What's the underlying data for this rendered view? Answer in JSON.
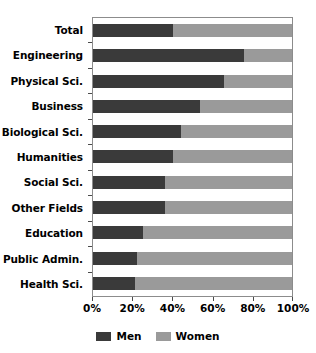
{
  "chart_data": {
    "type": "bar",
    "subtype": "horizontal-stacked-100-percent",
    "title": "",
    "xlabel": "",
    "ylabel": "",
    "xlim": [
      0,
      100
    ],
    "xticks": [
      0,
      20,
      40,
      60,
      80,
      100
    ],
    "xtick_labels": [
      "0%",
      "20%",
      "40%",
      "60%",
      "80%",
      "100%"
    ],
    "grid": false,
    "legend_position": "bottom-center",
    "categories": [
      "Total",
      "Engineering",
      "Physical Sci.",
      "Business",
      "Biological Sci.",
      "Humanities",
      "Social Sci.",
      "Other Fields",
      "Education",
      "Public Admin.",
      "Health Sci."
    ],
    "series": [
      {
        "name": "Men",
        "color": "#3a3a3a",
        "values": [
          40,
          76,
          66,
          54,
          44,
          40,
          36,
          36,
          25,
          22,
          21
        ]
      },
      {
        "name": "Women",
        "color": "#9a9a9a",
        "values": [
          60,
          24,
          34,
          46,
          56,
          60,
          64,
          64,
          75,
          78,
          79
        ]
      }
    ]
  },
  "legend": {
    "items": [
      {
        "label": "Men",
        "color": "#3a3a3a"
      },
      {
        "label": "Women",
        "color": "#9a9a9a"
      }
    ]
  },
  "axes": {
    "frame_color": "#8c8c8c",
    "tick_color": "#4a4a4a"
  }
}
